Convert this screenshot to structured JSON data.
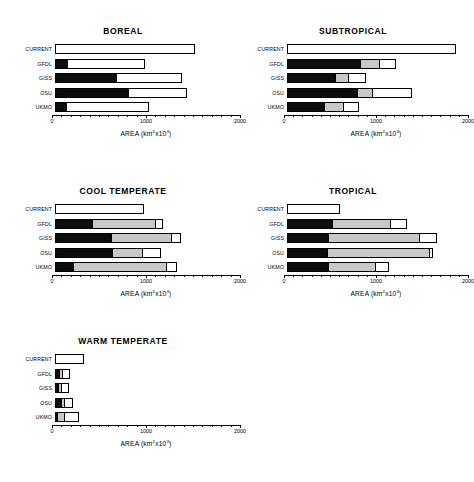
{
  "figure": {
    "axis_title_prefix": "AREA  (km",
    "axis_title_sup1": "2",
    "axis_title_mid": "x10",
    "axis_title_sup2": "3",
    "axis_title_suffix": ")",
    "row_labels": [
      "CURRENT",
      "GFDL",
      "GISS",
      "OSU",
      "UKMO"
    ],
    "tick_labels": [
      "0",
      "1000",
      "2000"
    ],
    "colors": {
      "black": "#0d0d0d",
      "gray": "#c8c8c8",
      "white": "#ffffff",
      "outline": "#000000",
      "background": "#ffffff"
    }
  },
  "chart_data": [
    {
      "type": "bar",
      "orientation": "horizontal",
      "stacked": true,
      "title": "BOREAL",
      "xlabel": "AREA (km2x103)",
      "ylabel": "",
      "xlim": [
        0,
        2000
      ],
      "xticks": [
        0,
        1000,
        2000
      ],
      "grid": false,
      "legend": "none",
      "categories": [
        "CURRENT",
        "GFDL",
        "GISS",
        "OSU",
        "UKMO"
      ],
      "series": [
        {
          "name": "black",
          "values": [
            0,
            130,
            660,
            790,
            120
          ]
        },
        {
          "name": "gray",
          "values": [
            0,
            0,
            0,
            0,
            0
          ]
        },
        {
          "name": "white",
          "values": [
            1490,
            830,
            690,
            610,
            880
          ]
        }
      ],
      "totals": [
        1490,
        960,
        1350,
        1400,
        1000
      ]
    },
    {
      "type": "bar",
      "orientation": "horizontal",
      "stacked": true,
      "title": "SUBTROPICAL",
      "xlabel": "AREA (km2x103)",
      "ylabel": "",
      "xlim": [
        0,
        2000
      ],
      "xticks": [
        0,
        1000,
        2000
      ],
      "grid": false,
      "legend": "none",
      "categories": [
        "CURRENT",
        "GFDL",
        "GISS",
        "OSU",
        "UKMO"
      ],
      "series": [
        {
          "name": "black",
          "values": [
            0,
            800,
            520,
            760,
            400
          ]
        },
        {
          "name": "gray",
          "values": [
            0,
            220,
            160,
            180,
            230
          ]
        },
        {
          "name": "white",
          "values": [
            1840,
            160,
            180,
            420,
            150
          ]
        }
      ],
      "totals": [
        1840,
        1180,
        860,
        1360,
        780
      ]
    },
    {
      "type": "bar",
      "orientation": "horizontal",
      "stacked": true,
      "title": "COOL TEMPERATE",
      "xlabel": "AREA (km2x103)",
      "ylabel": "",
      "xlim": [
        0,
        2000
      ],
      "xticks": [
        0,
        1000,
        2000
      ],
      "grid": false,
      "legend": "none",
      "categories": [
        "CURRENT",
        "GFDL",
        "GISS",
        "OSU",
        "UKMO"
      ],
      "series": [
        {
          "name": "black",
          "values": [
            0,
            390,
            590,
            610,
            180
          ]
        },
        {
          "name": "gray",
          "values": [
            0,
            690,
            660,
            330,
            1020
          ]
        },
        {
          "name": "white",
          "values": [
            950,
            70,
            90,
            190,
            100
          ]
        }
      ],
      "totals": [
        950,
        1150,
        1340,
        1130,
        1300
      ]
    },
    {
      "type": "bar",
      "orientation": "horizontal",
      "stacked": true,
      "title": "TROPICAL",
      "xlabel": "AREA (km2x103)",
      "ylabel": "",
      "xlim": [
        0,
        2000
      ],
      "xticks": [
        0,
        1000,
        2000
      ],
      "grid": false,
      "legend": "none",
      "categories": [
        "CURRENT",
        "GFDL",
        "GISS",
        "OSU",
        "UKMO"
      ],
      "series": [
        {
          "name": "black",
          "values": [
            0,
            490,
            440,
            430,
            440
          ]
        },
        {
          "name": "gray",
          "values": [
            0,
            650,
            1010,
            1140,
            540
          ]
        },
        {
          "name": "white",
          "values": [
            580,
            160,
            180,
            20,
            130
          ]
        }
      ],
      "totals": [
        580,
        1300,
        1630,
        1590,
        1110
      ]
    },
    {
      "type": "bar",
      "orientation": "horizontal",
      "stacked": true,
      "title": "WARM TEMPERATE",
      "xlabel": "AREA (km2x103)",
      "ylabel": "",
      "xlim": [
        0,
        2000
      ],
      "xticks": [
        0,
        1000,
        2000
      ],
      "grid": false,
      "legend": "none",
      "categories": [
        "CURRENT",
        "GFDL",
        "GISS",
        "OSU",
        "UKMO"
      ],
      "series": [
        {
          "name": "black",
          "values": [
            0,
            35,
            25,
            60,
            10
          ]
        },
        {
          "name": "gray",
          "values": [
            0,
            55,
            55,
            45,
            95
          ]
        },
        {
          "name": "white",
          "values": [
            310,
            70,
            65,
            85,
            145
          ]
        }
      ],
      "totals": [
        310,
        160,
        145,
        190,
        250
      ]
    }
  ]
}
